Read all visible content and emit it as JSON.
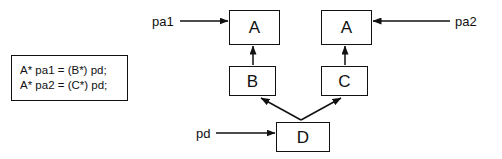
{
  "diagram": {
    "stroke_color": "#111111",
    "background_color": "#ffffff",
    "nodes": [
      {
        "id": "a_left",
        "label": "A",
        "x": 229,
        "y": 10,
        "width": 51,
        "height": 35
      },
      {
        "id": "a_right",
        "label": "A",
        "x": 321,
        "y": 10,
        "width": 51,
        "height": 35
      },
      {
        "id": "b",
        "label": "B",
        "x": 229,
        "y": 66,
        "width": 47,
        "height": 30
      },
      {
        "id": "c",
        "label": "C",
        "x": 321,
        "y": 66,
        "width": 47,
        "height": 30
      },
      {
        "id": "d",
        "label": "D",
        "x": 276,
        "y": 122,
        "width": 54,
        "height": 30
      }
    ],
    "pointer_labels": [
      {
        "id": "pa1",
        "text": "pa1",
        "x": 152,
        "y": 15
      },
      {
        "id": "pa2",
        "text": "pa2",
        "x": 455,
        "y": 15
      },
      {
        "id": "pd",
        "text": "pd",
        "x": 196,
        "y": 127
      }
    ],
    "edges": [
      {
        "id": "pa1-to-a-left",
        "from": "pa1",
        "to": "a_left",
        "kind": "pointer-arrow"
      },
      {
        "id": "pa2-to-a-right",
        "from": "pa2",
        "to": "a_right",
        "kind": "pointer-arrow"
      },
      {
        "id": "pd-to-d",
        "from": "pd",
        "to": "d",
        "kind": "pointer-arrow"
      },
      {
        "id": "b-to-a-left",
        "from": "b",
        "to": "a_left",
        "kind": "inheritance-arrow"
      },
      {
        "id": "c-to-a-right",
        "from": "c",
        "to": "a_right",
        "kind": "inheritance-arrow"
      },
      {
        "id": "d-to-b",
        "from": "d",
        "to": "b",
        "kind": "inheritance-arrow"
      },
      {
        "id": "d-to-c",
        "from": "d",
        "to": "c",
        "kind": "inheritance-arrow"
      }
    ]
  },
  "code_box": {
    "lines": [
      "A* pa1 = (B*) pd;",
      "A* pa2 = (C*) pd;"
    ]
  }
}
